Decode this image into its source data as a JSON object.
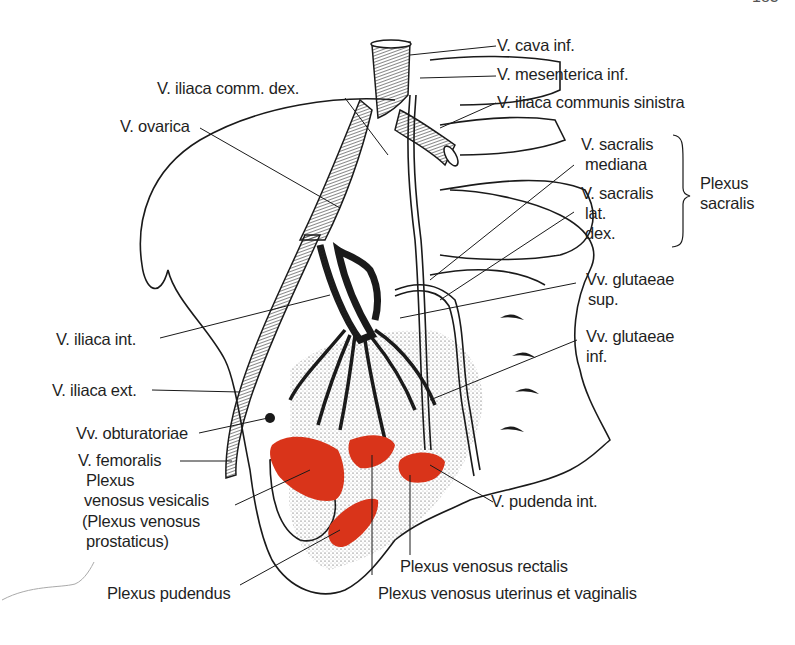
{
  "page": {
    "number_partial": "183"
  },
  "figure": {
    "type": "anatomical-illustration",
    "accent_color": "#d9341a",
    "line_color": "#1a1a1a"
  },
  "labels": {
    "v_cava_inf": "V. cava inf.",
    "v_mesenterica_inf": "V. mesenterica inf.",
    "v_iliaca_communis_sinistra": "V. iliaca communis sinistra",
    "v_iliaca_comm_dex": "V. iliaca comm. dex.",
    "v_ovarica": "V. ovarica",
    "v_sacralis_mediana_1": "V. sacralis",
    "v_sacralis_mediana_2": "mediana",
    "v_sacralis_lat_1": "V. sacralis",
    "v_sacralis_lat_2": "lat.",
    "v_sacralis_lat_3": "dex.",
    "plexus_sacralis_1": "Plexus",
    "plexus_sacralis_2": "sacralis",
    "vv_glutaeae_sup_1": "Vv. glutaeae",
    "vv_glutaeae_sup_2": "sup.",
    "vv_glutaeae_inf_1": "Vv. glutaeae",
    "vv_glutaeae_inf_2": "inf.",
    "v_iliaca_int": "V. iliaca  int.",
    "v_iliaca_ext": "V. iliaca ext.",
    "vv_obturatoriae": "Vv. obturatoriae",
    "v_femoralis": "V. femoralis",
    "plexus_vesicalis_1": "Plexus",
    "plexus_vesicalis_2": "venosus vesicalis",
    "plexus_vesicalis_3": "(Plexus venosus",
    "plexus_vesicalis_4": "prostaticus)",
    "v_pudenda_int": "V. pudenda int.",
    "plexus_venosus_rectalis": "Plexus venosus rectalis",
    "plexus_pudendus": "Plexus pudendus",
    "plexus_uterinus_vaginalis": "Plexus venosus uterinus et vaginalis"
  }
}
